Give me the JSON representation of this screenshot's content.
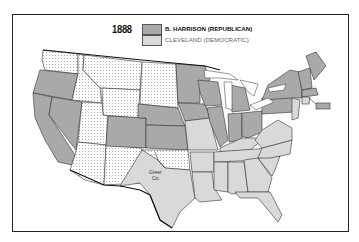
{
  "map": {
    "year": "1888",
    "legend": [
      {
        "label": "B. HARRISON (REPUBLICAN)",
        "color": "#a9a9a9"
      },
      {
        "label": "CLEVELAND (DEMOCRATIC)",
        "color": "#d9d9d9"
      }
    ],
    "territory_pattern": "dotted white",
    "annotation": "Greer Co.",
    "colors": {
      "republican": "#a9a9a9",
      "democratic": "#d9d9d9",
      "territory": "#ffffff",
      "border": "#333333"
    }
  }
}
